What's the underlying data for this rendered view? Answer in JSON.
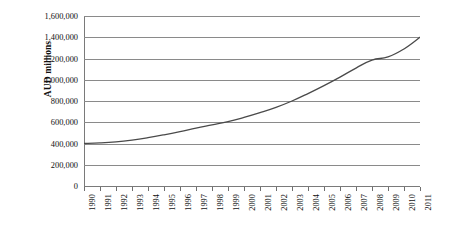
{
  "chart_data": {
    "type": "line",
    "title": "",
    "xlabel": "",
    "ylabel": "AUD millions",
    "x": [
      1990,
      1991,
      1992,
      1993,
      1994,
      1995,
      1996,
      1997,
      1998,
      1999,
      2000,
      2001,
      2002,
      2003,
      2004,
      2005,
      2006,
      2007,
      2008,
      2009,
      2010,
      2011
    ],
    "categories": [
      "1990",
      "1991",
      "1992",
      "1993",
      "1994",
      "1995",
      "1996",
      "1997",
      "1998",
      "1999",
      "2000",
      "2001",
      "2002",
      "2003",
      "2004",
      "2005",
      "2006",
      "2007",
      "2008",
      "2009",
      "2010",
      "2011"
    ],
    "series": [
      {
        "name": "AUD millions",
        "color": "#4a4a4a",
        "values": [
          400000,
          405000,
          415000,
          432000,
          455000,
          482000,
          512000,
          545000,
          575000,
          605000,
          645000,
          690000,
          740000,
          800000,
          870000,
          945000,
          1025000,
          1110000,
          1185000,
          1215000,
          1290000,
          1400000
        ]
      }
    ],
    "ylim": [
      0,
      1600000
    ],
    "yticks": [
      0,
      200000,
      400000,
      600000,
      800000,
      1000000,
      1200000,
      1400000,
      1600000
    ],
    "ytick_labels": [
      "0",
      "200,000",
      "400,000",
      "600,000",
      "800,000",
      "1,000,000",
      "1,200,000",
      "1,400,000",
      "1,600,000"
    ],
    "grid": "horizontal",
    "legend": "none",
    "xlim": [
      1990,
      2011
    ]
  },
  "colors": {
    "line": "#4a4a4a",
    "grid": "#8a8a8a",
    "axis": "#7a7a7a",
    "text": "#111111",
    "background": "#ffffff"
  }
}
